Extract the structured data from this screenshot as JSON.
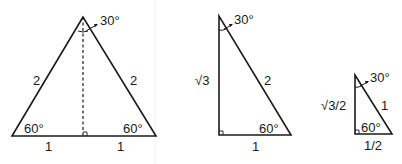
{
  "figures": [
    {
      "name": "equilateral-triangle-split",
      "labels": {
        "apex_angle": "30°",
        "left_side": "2",
        "right_side": "2",
        "left_angle": "60°",
        "right_angle": "60°",
        "base_left": "1",
        "base_right": "1"
      }
    },
    {
      "name": "right-triangle-30-60-90",
      "labels": {
        "top_angle": "30°",
        "vertical_side": "√3",
        "hypotenuse": "2",
        "bottom_angle": "60°",
        "base": "1"
      }
    },
    {
      "name": "small-right-triangle-30-60-90",
      "labels": {
        "top_angle": "30°",
        "vertical_side": "√3/2",
        "hypotenuse": "1",
        "bottom_angle": "60°",
        "base": "1/2"
      }
    }
  ],
  "colors": {
    "stroke": "#1a1a1a",
    "background": "#ffffff"
  }
}
